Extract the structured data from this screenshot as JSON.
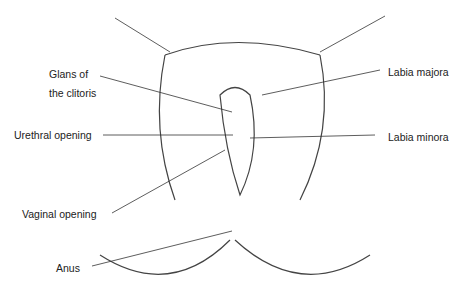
{
  "diagram": {
    "labels": {
      "glans_line1": "Glans of",
      "glans_line2": "the clitoris",
      "urethral_opening": "Urethral opening",
      "vaginal_opening": "Vaginal opening",
      "anus": "Anus",
      "labia_majora": "Labia majora",
      "labia_minora": "Labia minora"
    },
    "colors": {
      "line": "#333333",
      "text": "#222222",
      "background": "#ffffff"
    }
  }
}
